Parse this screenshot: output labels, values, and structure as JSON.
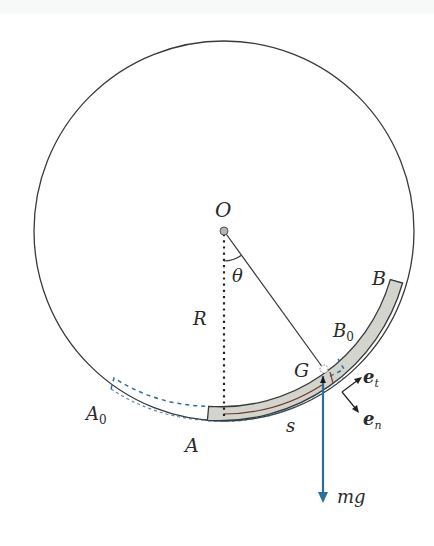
{
  "figure": {
    "colors": {
      "outline": "#3a3a3a",
      "bar_fill": "#d4d4cf",
      "accent_blue": "#2a6f9a",
      "background": "#ffffff"
    }
  },
  "labels": {
    "center": "O",
    "angle": "θ",
    "radius": "R",
    "end_b": "B",
    "end_b0_main": "B",
    "end_b0_sub": "0",
    "end_a": "A",
    "end_a0_main": "A",
    "end_a0_sub": "0",
    "centroid": "G",
    "arc_length": "s",
    "tangent_vec_main": "e",
    "tangent_vec_sub": "t",
    "normal_vec_main": "e",
    "normal_vec_sub": "n",
    "weight": "mg"
  }
}
